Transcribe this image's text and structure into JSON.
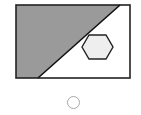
{
  "figure": {
    "rect": {
      "x": 16,
      "y": 5,
      "width": 114,
      "height": 73,
      "stroke": "#222222"
    },
    "shaded_region": {
      "fill": "#9a9a9a",
      "points": "16,5 120,5 38,78 16,78"
    },
    "diagonal": {
      "x1": 120,
      "y1": 5,
      "x2": 38,
      "y2": 78,
      "stroke": "#111111"
    },
    "hexagon": {
      "points": "82,47 89,35 106,35 113,47 106,59 89,59",
      "fill": "#eeeeee",
      "stroke": "#222222"
    }
  },
  "answer_option": {
    "selected": false,
    "color": "#a8a8a8"
  }
}
